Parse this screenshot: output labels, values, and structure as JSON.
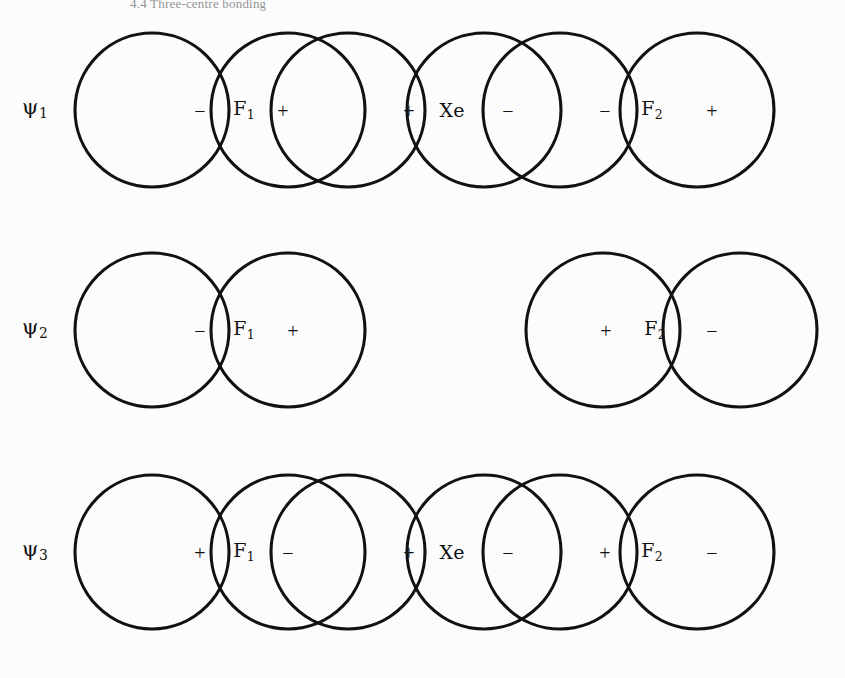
{
  "figure": {
    "caption_top": "4.4 Three-centre bonding",
    "background_color": "#fcfcfc",
    "stroke_color": "#111111",
    "width": 845,
    "height": 678
  },
  "chart_data": {
    "type": "diagram",
    "atoms": [
      "F",
      "Xe",
      "F"
    ],
    "orbitals": [
      {
        "name": "psi1",
        "label": "ψ",
        "subscript": "1",
        "character": "bonding",
        "nodes": 0,
        "lobes": [
          {
            "atom": "F",
            "atom_sub": "1",
            "left_sign": "−",
            "right_sign": "+"
          },
          {
            "atom": "Xe",
            "atom_sub": "",
            "left_sign": "+",
            "right_sign": "−"
          },
          {
            "atom": "F",
            "atom_sub": "2",
            "left_sign": "−",
            "right_sign": "+"
          }
        ],
        "sign_sequence": [
          "−",
          "+",
          "+",
          "−",
          "−",
          "+"
        ],
        "overlapping": true
      },
      {
        "name": "psi2",
        "label": "ψ",
        "subscript": "2",
        "character": "non-bonding",
        "nodes": 1,
        "lobes": [
          {
            "atom": "F",
            "atom_sub": "1",
            "left_sign": "−",
            "right_sign": "+"
          },
          {
            "atom": "F",
            "atom_sub": "2",
            "left_sign": "+",
            "right_sign": "−"
          }
        ],
        "sign_sequence": [
          "−",
          "+",
          "+",
          "−"
        ],
        "overlapping": false,
        "xe_coefficient_zero": true
      },
      {
        "name": "psi3",
        "label": "ψ",
        "subscript": "3",
        "character": "antibonding",
        "nodes": 2,
        "lobes": [
          {
            "atom": "F",
            "atom_sub": "1",
            "left_sign": "+",
            "right_sign": "−"
          },
          {
            "atom": "Xe",
            "atom_sub": "",
            "left_sign": "+",
            "right_sign": "−"
          },
          {
            "atom": "F",
            "atom_sub": "2",
            "left_sign": "+",
            "right_sign": "−"
          }
        ],
        "sign_sequence": [
          "+",
          "−",
          "+",
          "−",
          "+",
          "−"
        ],
        "overlapping": true
      }
    ]
  },
  "rows": [
    {
      "id": "psi1",
      "psi": "ψ",
      "psi_sub": "1",
      "psi_x": 22,
      "psi_y": 108,
      "top": 0,
      "circles": [
        {
          "cx": 152,
          "cy": 110,
          "r": 77
        },
        {
          "cx": 288,
          "cy": 110,
          "r": 77
        },
        {
          "cx": 348,
          "cy": 110,
          "r": 77
        },
        {
          "cx": 484,
          "cy": 110,
          "r": 77
        },
        {
          "cx": 560,
          "cy": 110,
          "r": 77
        },
        {
          "cx": 697,
          "cy": 110,
          "r": 77
        }
      ],
      "marks": [
        {
          "kind": "sign",
          "text": "−",
          "x": 200,
          "y": 111,
          "name": "phase-sign-minus"
        },
        {
          "kind": "atom",
          "text": "F",
          "sub": "1",
          "x": 244,
          "y": 110,
          "name": "atom-label-f1"
        },
        {
          "kind": "sign",
          "text": "+",
          "x": 283,
          "y": 111,
          "name": "phase-sign-plus"
        },
        {
          "kind": "sign",
          "text": "+",
          "x": 409,
          "y": 111,
          "name": "phase-sign-plus"
        },
        {
          "kind": "atom",
          "text": "Xe",
          "sub": "",
          "x": 452,
          "y": 110,
          "name": "atom-label-xe"
        },
        {
          "kind": "sign",
          "text": "−",
          "x": 508,
          "y": 111,
          "name": "phase-sign-minus"
        },
        {
          "kind": "sign",
          "text": "−",
          "x": 605,
          "y": 111,
          "name": "phase-sign-minus"
        },
        {
          "kind": "atom",
          "text": "F",
          "sub": "2",
          "x": 652,
          "y": 110,
          "name": "atom-label-f2"
        },
        {
          "kind": "sign",
          "text": "+",
          "x": 712,
          "y": 111,
          "name": "phase-sign-plus"
        }
      ]
    },
    {
      "id": "psi2",
      "psi": "ψ",
      "psi_sub": "2",
      "psi_x": 22,
      "psi_y": 328,
      "top": 220,
      "circles": [
        {
          "cx": 152,
          "cy": 110,
          "r": 77
        },
        {
          "cx": 288,
          "cy": 110,
          "r": 77
        },
        {
          "cx": 603,
          "cy": 110,
          "r": 77
        },
        {
          "cx": 740,
          "cy": 110,
          "r": 77
        }
      ],
      "marks": [
        {
          "kind": "sign",
          "text": "−",
          "x": 200,
          "y": 111,
          "name": "phase-sign-minus"
        },
        {
          "kind": "atom",
          "text": "F",
          "sub": "1",
          "x": 244,
          "y": 110,
          "name": "atom-label-f1"
        },
        {
          "kind": "sign",
          "text": "+",
          "x": 293,
          "y": 111,
          "name": "phase-sign-plus"
        },
        {
          "kind": "sign",
          "text": "+",
          "x": 606,
          "y": 111,
          "name": "phase-sign-plus"
        },
        {
          "kind": "atom",
          "text": "F",
          "sub": "2",
          "x": 655,
          "y": 110,
          "name": "atom-label-f2"
        },
        {
          "kind": "sign",
          "text": "−",
          "x": 712,
          "y": 111,
          "name": "phase-sign-minus"
        }
      ]
    },
    {
      "id": "psi3",
      "psi": "ψ",
      "psi_sub": "3",
      "psi_x": 22,
      "psi_y": 550,
      "top": 442,
      "circles": [
        {
          "cx": 152,
          "cy": 110,
          "r": 77
        },
        {
          "cx": 288,
          "cy": 110,
          "r": 77
        },
        {
          "cx": 348,
          "cy": 110,
          "r": 77
        },
        {
          "cx": 484,
          "cy": 110,
          "r": 77
        },
        {
          "cx": 560,
          "cy": 110,
          "r": 77
        },
        {
          "cx": 697,
          "cy": 110,
          "r": 77
        }
      ],
      "marks": [
        {
          "kind": "sign",
          "text": "+",
          "x": 200,
          "y": 111,
          "name": "phase-sign-plus"
        },
        {
          "kind": "atom",
          "text": "F",
          "sub": "1",
          "x": 244,
          "y": 110,
          "name": "atom-label-f1"
        },
        {
          "kind": "sign",
          "text": "−",
          "x": 288,
          "y": 111,
          "name": "phase-sign-minus"
        },
        {
          "kind": "sign",
          "text": "+",
          "x": 409,
          "y": 111,
          "name": "phase-sign-plus"
        },
        {
          "kind": "atom",
          "text": "Xe",
          "sub": "",
          "x": 452,
          "y": 110,
          "name": "atom-label-xe"
        },
        {
          "kind": "sign",
          "text": "−",
          "x": 508,
          "y": 111,
          "name": "phase-sign-minus"
        },
        {
          "kind": "sign",
          "text": "+",
          "x": 605,
          "y": 111,
          "name": "phase-sign-plus"
        },
        {
          "kind": "atom",
          "text": "F",
          "sub": "2",
          "x": 652,
          "y": 110,
          "name": "atom-label-f2"
        },
        {
          "kind": "sign",
          "text": "−",
          "x": 712,
          "y": 111,
          "name": "phase-sign-minus"
        }
      ]
    }
  ]
}
